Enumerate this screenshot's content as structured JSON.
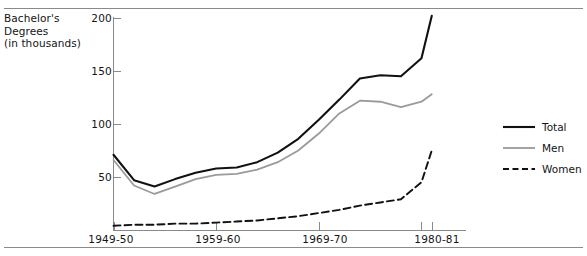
{
  "figure": {
    "axis_title_lines": [
      "Bachelor's",
      "Degrees",
      "(in thousands)"
    ],
    "axis_title": "Bachelor's Degrees (in thousands)"
  },
  "colors": {
    "total": "#111111",
    "men": "#9a9a9a",
    "women": "#111111",
    "axis": "#8a8a8a",
    "rule": "#8a8a8a",
    "text": "#141414"
  },
  "legend": {
    "position": "right",
    "items": [
      {
        "label": "Total",
        "style": "solid",
        "color": "#111111"
      },
      {
        "label": "Men",
        "style": "solid",
        "color": "#9a9a9a"
      },
      {
        "label": "Women",
        "style": "dashed",
        "color": "#111111"
      }
    ]
  },
  "chart_data": {
    "type": "line",
    "title": "",
    "subtitle": "",
    "xlabel": "",
    "ylabel": "Bachelor's Degrees (in thousands)",
    "grid": false,
    "legend_position": "right",
    "ylim": [
      0,
      200
    ],
    "yticks": [
      50,
      100,
      150,
      200
    ],
    "ytick_labels": [
      "50",
      "100",
      "150",
      "200"
    ],
    "xlim": [
      1949,
      1981
    ],
    "xticks": [
      1949,
      1959,
      1969,
      1979,
      1980
    ],
    "xtick_labels": [
      "1949-50",
      "1959-60",
      "1969-70",
      "1980-81"
    ],
    "xtick_label_years": [
      1949,
      1959,
      1969,
      1980
    ],
    "x": [
      1949,
      1951,
      1953,
      1955,
      1957,
      1959,
      1961,
      1963,
      1965,
      1967,
      1969,
      1971,
      1973,
      1975,
      1977,
      1979,
      1980
    ],
    "series": [
      {
        "name": "Total",
        "values": [
          71,
          47,
          41,
          48,
          54,
          58,
          59,
          64,
          73,
          86,
          104,
          123,
          143,
          146,
          145,
          162,
          202
        ]
      },
      {
        "name": "Men",
        "values": [
          66,
          42,
          34,
          41,
          48,
          52,
          53,
          57,
          64,
          75,
          91,
          110,
          122,
          121,
          116,
          121,
          128
        ]
      },
      {
        "name": "Women",
        "values": [
          4,
          5,
          5,
          6,
          6,
          7,
          8,
          9,
          11,
          13,
          16,
          19,
          23,
          26,
          29,
          45,
          75
        ]
      }
    ]
  }
}
